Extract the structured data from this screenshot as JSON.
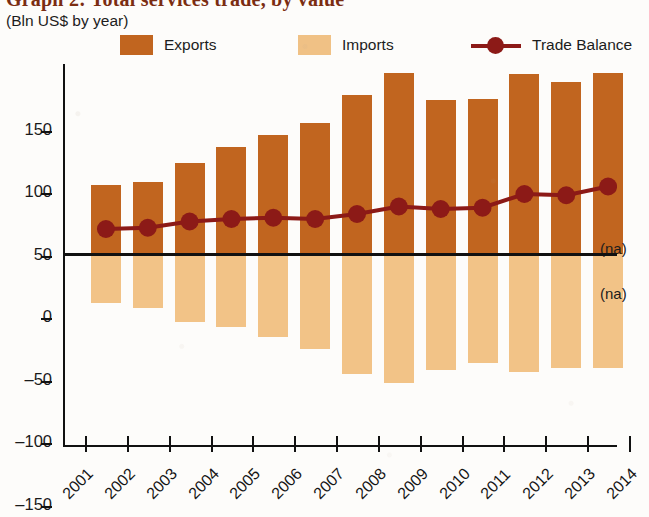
{
  "title": "Graph 2: Total services trade, by value",
  "subtitle": "(Bln US$ by year)",
  "legend": [
    {
      "label": "Exports",
      "type": "swatch",
      "color": "#c1651f"
    },
    {
      "label": "Imports",
      "type": "swatch",
      "color": "#f0c185"
    },
    {
      "label": "Trade Balance",
      "type": "line",
      "color": "#8c1a17"
    }
  ],
  "annotations": [
    {
      "text": "(na)",
      "position": "above-axis-right"
    },
    {
      "text": "(na)",
      "position": "below-axis-right"
    }
  ],
  "chart_data": {
    "type": "bar",
    "title": "Graph 2: Total services trade, by value",
    "subtitle": "(Bln US$ by year)",
    "xlabel": "",
    "ylabel": "Bln US$",
    "ylim": [
      -150,
      150
    ],
    "yticks": [
      150,
      100,
      50,
      0,
      -50,
      -100,
      -150
    ],
    "xticks": [
      "2001",
      "2002",
      "2003",
      "2004",
      "2005",
      "2006",
      "2007",
      "2008",
      "2009",
      "2010",
      "2011",
      "2012",
      "2013",
      "2014"
    ],
    "categories": [
      "2001",
      "2002",
      "2003",
      "2004",
      "2005",
      "2006",
      "2007",
      "2008",
      "2009",
      "2010",
      "2011",
      "2012",
      "2013"
    ],
    "grid": false,
    "legend_position": "top",
    "series": [
      {
        "name": "Exports",
        "type": "bar",
        "color": "#c1651f",
        "values": [
          55,
          58,
          73,
          86,
          95,
          105,
          127,
          145,
          123,
          124,
          144,
          138,
          145
        ]
      },
      {
        "name": "Imports",
        "type": "bar",
        "color": "#f2c387",
        "values": [
          -39,
          -43,
          -54,
          -58,
          -66,
          -76,
          -96,
          -103,
          -93,
          -87,
          -94,
          -91,
          -91
        ]
      },
      {
        "name": "Trade Balance",
        "type": "line",
        "color": "#8c1a17",
        "values": [
          20,
          21,
          26,
          28,
          29,
          28,
          32,
          38,
          36,
          37,
          48,
          47,
          54
        ]
      }
    ]
  }
}
